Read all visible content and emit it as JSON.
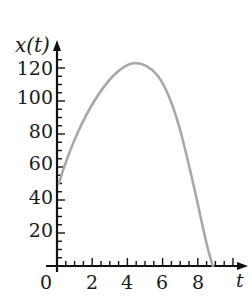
{
  "chart_data": {
    "type": "line",
    "title": "",
    "xlabel": "t",
    "ylabel": "x(t)",
    "xlim": [
      0,
      10
    ],
    "ylim": [
      0,
      125
    ],
    "x_ticks": [
      "0",
      "2",
      "4",
      "6",
      "8"
    ],
    "y_ticks": [
      "20",
      "40",
      "60",
      "80",
      "100",
      "120"
    ],
    "origin_label": "0",
    "grid": false,
    "legend": null,
    "series": [
      {
        "name": "x(t)",
        "color": "#a8a8a8",
        "x": [
          0,
          0.7,
          1.6,
          2.5,
          3.4,
          4.4,
          5.3,
          6.7,
          7.6,
          8.5,
          9.0
        ],
        "y": [
          50,
          70,
          91,
          107,
          118,
          122,
          116,
          98,
          64,
          28,
          0
        ]
      }
    ]
  },
  "axes": {
    "y_label": "x(t)",
    "x_label": "t",
    "origin": "0",
    "y_ticks": [
      "120",
      "100",
      "80",
      "60",
      "40",
      "20"
    ],
    "x_ticks": [
      "2",
      "4",
      "6",
      "8"
    ]
  }
}
